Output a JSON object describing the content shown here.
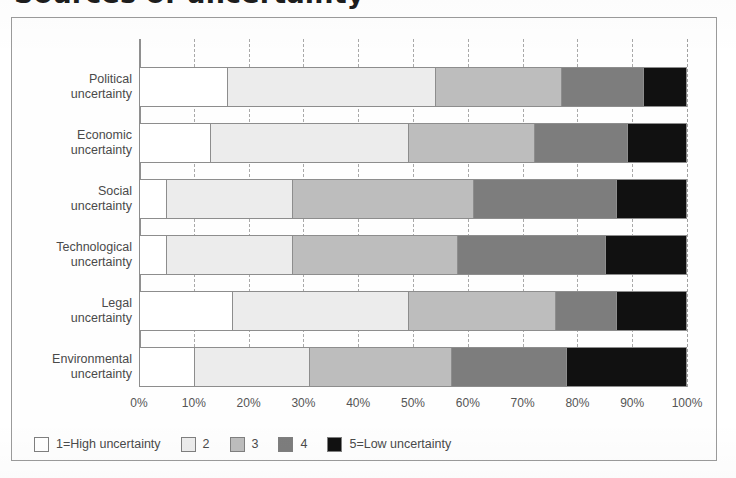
{
  "figure": {
    "title": "Sources of uncertainty",
    "title_cropped": true
  },
  "axis": {
    "x_ticks": [
      "0%",
      "10%",
      "20%",
      "30%",
      "40%",
      "50%",
      "60%",
      "70%",
      "80%",
      "90%",
      "100%"
    ]
  },
  "legend": {
    "items": [
      {
        "label": "1=High uncertainty",
        "color": "#ffffff"
      },
      {
        "label": "2",
        "color": "#ececec"
      },
      {
        "label": "3",
        "color": "#bdbdbd"
      },
      {
        "label": "4",
        "color": "#7d7d7d"
      },
      {
        "label": "5=Low uncertainty",
        "color": "#111111"
      }
    ]
  },
  "categories": [
    {
      "line1": "Political",
      "line2": "uncertainty"
    },
    {
      "line1": "Economic",
      "line2": "uncertainty"
    },
    {
      "line1": "Social",
      "line2": "uncertainty"
    },
    {
      "line1": "Technological",
      "line2": "uncertainty"
    },
    {
      "line1": "Legal",
      "line2": "uncertainty"
    },
    {
      "line1": "Environmental",
      "line2": "uncertainty"
    }
  ],
  "chart_data": {
    "type": "bar",
    "orientation": "horizontal",
    "stacked": true,
    "stacked_normalized": true,
    "title": "Sources of uncertainty",
    "xlabel": "",
    "ylabel": "",
    "xlim": [
      0,
      100
    ],
    "grid": true,
    "legend_position": "bottom-left",
    "categories": [
      "Political uncertainty",
      "Economic uncertainty",
      "Social uncertainty",
      "Technological uncertainty",
      "Legal uncertainty",
      "Environmental uncertainty"
    ],
    "series": [
      {
        "name": "1=High uncertainty",
        "color": "#ffffff",
        "values": [
          16,
          13,
          5,
          5,
          17,
          10
        ]
      },
      {
        "name": "2",
        "color": "#ececec",
        "values": [
          38,
          36,
          23,
          23,
          32,
          21
        ]
      },
      {
        "name": "3",
        "color": "#bdbdbd",
        "values": [
          23,
          23,
          33,
          30,
          27,
          26
        ]
      },
      {
        "name": "4",
        "color": "#7d7d7d",
        "values": [
          15,
          17,
          26,
          27,
          11,
          21
        ]
      },
      {
        "name": "5=Low uncertainty",
        "color": "#111111",
        "values": [
          8,
          11,
          13,
          15,
          13,
          22
        ]
      }
    ],
    "cumulative_boundaries": {
      "Political uncertainty": [
        16,
        54,
        77,
        92,
        100
      ],
      "Economic uncertainty": [
        13,
        49,
        72,
        89,
        100
      ],
      "Social uncertainty": [
        5,
        28,
        61,
        87,
        100
      ],
      "Technological uncertainty": [
        5,
        28,
        58,
        85,
        100
      ],
      "Legal uncertainty": [
        17,
        49,
        76,
        87,
        100
      ],
      "Environmental uncertainty": [
        10,
        31,
        57,
        78,
        100
      ]
    }
  }
}
